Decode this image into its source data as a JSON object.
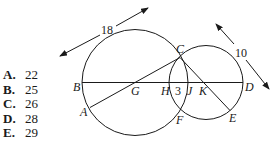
{
  "answer_choices": [
    {
      "letter": "A.",
      "value": "22"
    },
    {
      "letter": "B.",
      "value": "25"
    },
    {
      "letter": "C.",
      "value": "26"
    },
    {
      "letter": "D.",
      "value": "28"
    },
    {
      "letter": "E.",
      "value": "29"
    }
  ],
  "diagram": {
    "point_labels": {
      "A": "A",
      "B": "B",
      "C": "C",
      "D": "D",
      "E": "E",
      "F": "F",
      "G": "G",
      "H": "H",
      "J": "J",
      "K": "K"
    },
    "measurements": {
      "large_diameter": "18",
      "small_diameter": "10",
      "overlap_HJ": "3"
    },
    "colors": {
      "stroke": "#1a1a1a"
    }
  }
}
